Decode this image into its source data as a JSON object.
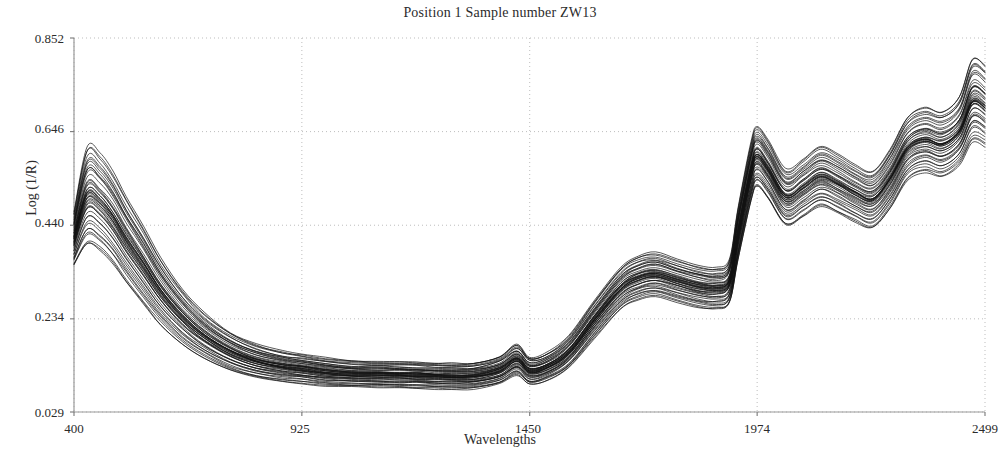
{
  "chart_data": {
    "type": "line",
    "title": "Position 1 Sample number ZW13",
    "xlabel": "Wavelengths",
    "ylabel": "Log  (1/R)",
    "xlim": [
      400,
      2499
    ],
    "ylim": [
      0.029,
      0.852
    ],
    "xticks": [
      400,
      925,
      1450,
      1974,
      2499
    ],
    "xtick_labels": [
      "400",
      "925",
      "1450",
      "1974",
      "2499"
    ],
    "yticks": [
      0.029,
      0.234,
      0.44,
      0.646,
      0.852
    ],
    "ytick_labels": [
      "0.029",
      "0.234",
      "0.440",
      "0.646",
      "0.852"
    ],
    "grid": true,
    "grid_style": "dotted",
    "legend": null,
    "series_color": "#111111",
    "n_series": 46,
    "x": [
      400,
      430,
      460,
      490,
      520,
      560,
      600,
      650,
      700,
      760,
      820,
      880,
      925,
      980,
      1040,
      1100,
      1150,
      1190,
      1230,
      1270,
      1320,
      1380,
      1420,
      1450,
      1490,
      1540,
      1600,
      1660,
      1700,
      1740,
      1790,
      1840,
      1880,
      1910,
      1930,
      1960,
      1974,
      2000,
      2040,
      2080,
      2120,
      2160,
      2200,
      2240,
      2280,
      2320,
      2360,
      2400,
      2440,
      2470,
      2499
    ],
    "series": [
      {
        "name": "spectrum-mean",
        "values": [
          0.42,
          0.47,
          0.455,
          0.42,
          0.375,
          0.32,
          0.268,
          0.218,
          0.182,
          0.15,
          0.131,
          0.121,
          0.116,
          0.11,
          0.106,
          0.105,
          0.104,
          0.103,
          0.101,
          0.1,
          0.101,
          0.114,
          0.138,
          0.113,
          0.122,
          0.155,
          0.23,
          0.3,
          0.322,
          0.33,
          0.316,
          0.303,
          0.3,
          0.315,
          0.42,
          0.555,
          0.59,
          0.56,
          0.5,
          0.52,
          0.545,
          0.53,
          0.508,
          0.495,
          0.54,
          0.605,
          0.625,
          0.615,
          0.645,
          0.7,
          0.69
        ]
      },
      {
        "name": "spectrum-upper-envelope",
        "values": [
          0.47,
          0.615,
          0.6,
          0.56,
          0.505,
          0.44,
          0.37,
          0.3,
          0.248,
          0.205,
          0.178,
          0.163,
          0.156,
          0.148,
          0.142,
          0.141,
          0.14,
          0.139,
          0.137,
          0.136,
          0.137,
          0.152,
          0.178,
          0.15,
          0.16,
          0.196,
          0.275,
          0.348,
          0.372,
          0.38,
          0.366,
          0.352,
          0.348,
          0.366,
          0.48,
          0.625,
          0.66,
          0.628,
          0.565,
          0.588,
          0.615,
          0.598,
          0.575,
          0.56,
          0.608,
          0.678,
          0.7,
          0.69,
          0.722,
          0.805,
          0.79
        ]
      },
      {
        "name": "spectrum-lower-envelope",
        "values": [
          0.35,
          0.395,
          0.382,
          0.352,
          0.312,
          0.264,
          0.218,
          0.176,
          0.146,
          0.12,
          0.104,
          0.096,
          0.092,
          0.087,
          0.084,
          0.083,
          0.082,
          0.081,
          0.08,
          0.079,
          0.08,
          0.09,
          0.11,
          0.09,
          0.098,
          0.126,
          0.192,
          0.255,
          0.276,
          0.283,
          0.27,
          0.258,
          0.255,
          0.268,
          0.362,
          0.492,
          0.524,
          0.496,
          0.44,
          0.458,
          0.48,
          0.466,
          0.446,
          0.434,
          0.476,
          0.538,
          0.556,
          0.546,
          0.572,
          0.622,
          0.612
        ]
      }
    ]
  },
  "figure": {
    "title": "Position 1 Sample number ZW13",
    "x_axis_label": "Wavelengths",
    "y_axis_label": "Log  (1/R)",
    "y_tick_0": "0.852",
    "y_tick_1": "0.646",
    "y_tick_2": "0.440",
    "y_tick_3": "0.234",
    "y_tick_4": "0.029",
    "x_tick_0": "400",
    "x_tick_1": "925",
    "x_tick_2": "1450",
    "x_tick_3": "1974",
    "x_tick_4": "2499"
  }
}
